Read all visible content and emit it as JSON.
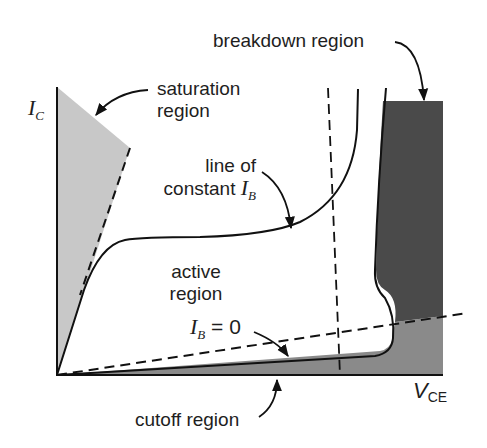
{
  "figure": {
    "axis": {
      "y_label_main": "I",
      "y_label_sub": "C",
      "x_label_main": "V",
      "x_label_sub": "CE"
    },
    "labels": {
      "breakdown": "breakdown region",
      "saturation_line1": "saturation",
      "saturation_line2": "region",
      "constant_ib_line1": "line of",
      "constant_ib_line2": "constant ",
      "constant_ib_var": "I",
      "constant_ib_sub": "B",
      "active_line1": "active",
      "active_line2": "region",
      "ib_zero_var": "I",
      "ib_zero_sub": "B",
      "ib_zero_eq": " = 0",
      "cutoff": "cutoff region"
    },
    "regions": [
      {
        "name": "saturation region",
        "fill": "#c8c8c8"
      },
      {
        "name": "breakdown region",
        "fill": "#4a4a4a"
      },
      {
        "name": "cutoff region",
        "fill": "#8a8a8a"
      },
      {
        "name": "active region",
        "fill": "#ffffff"
      }
    ],
    "colors": {
      "line": "#111111",
      "saturation_fill": "#c8c8c8",
      "breakdown_fill": "#4a4a4a",
      "cutoff_fill": "#8a8a8a"
    }
  }
}
